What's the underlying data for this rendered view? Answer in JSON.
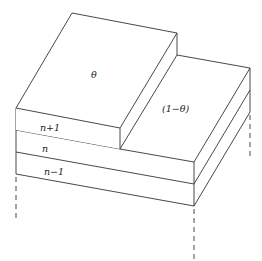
{
  "diagram": {
    "type": "crystal-surface-layers",
    "labels": {
      "top_coverage": "θ",
      "uncovered_fraction": "(1−θ)",
      "layer_top": "n+1",
      "layer_mid": "n",
      "layer_bottom": "n−1"
    },
    "colors": {
      "line": "#333333",
      "background": "#ffffff"
    }
  }
}
